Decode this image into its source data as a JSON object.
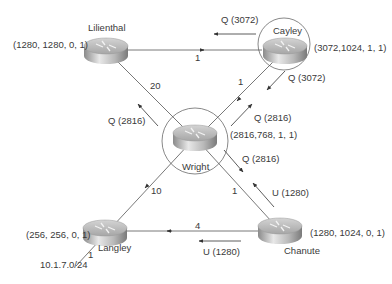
{
  "routers": [
    {
      "name": "Lilienthal",
      "metrics": "(1280, 1280, 0, 1)"
    },
    {
      "name": "Cayley",
      "metrics": "(3072,1024, 1, 1)"
    },
    {
      "name": "Wright",
      "metrics": "(2816,768, 1, 1)"
    },
    {
      "name": "Langley",
      "metrics": "(256, 256, 0, 1)"
    },
    {
      "name": "Chanute",
      "metrics": "(1280, 1024, 0, 1)"
    }
  ],
  "links": [
    {
      "from": "Lilienthal",
      "to": "Cayley",
      "cost": "1"
    },
    {
      "from": "Lilienthal",
      "to": "Wright",
      "cost": "20"
    },
    {
      "from": "Cayley",
      "to": "Wright",
      "cost": "1"
    },
    {
      "from": "Wright",
      "to": "Langley",
      "cost": "10"
    },
    {
      "from": "Wright",
      "to": "Chanute",
      "cost": "1"
    },
    {
      "from": "Chanute",
      "to": "Langley",
      "cost": "4"
    },
    {
      "from": "Langley",
      "to": "10.1.7.0/24",
      "cost": "1"
    }
  ],
  "messages": [
    {
      "label": "Q (3072)",
      "from": "Cayley",
      "to": "Lilienthal"
    },
    {
      "label": "Q (3072)",
      "from": "Cayley",
      "to": "Wright"
    },
    {
      "label": "Q (2816)",
      "from": "Wright",
      "to": "Cayley"
    },
    {
      "label": "Q (2816)",
      "from": "Wright",
      "to": "Lilienthal"
    },
    {
      "label": "Q (2816)",
      "from": "Wright",
      "to": "Chanute"
    },
    {
      "label": "U (1280)",
      "from": "Chanute",
      "to": "Wright"
    },
    {
      "label": "U (1280)",
      "from": "Chanute",
      "to": "Langley"
    }
  ],
  "network": {
    "prefix": "10.1.7.0/24"
  }
}
